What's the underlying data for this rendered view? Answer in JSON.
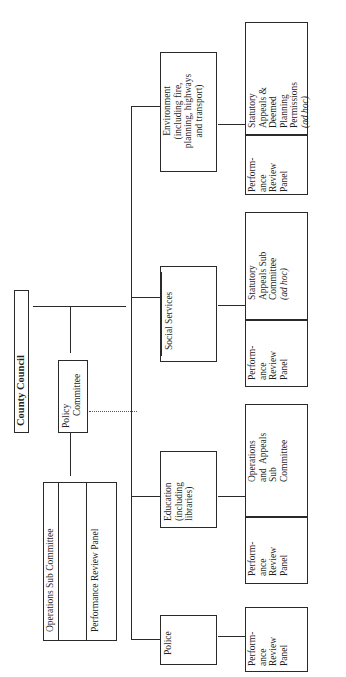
{
  "diagram": {
    "orientation": "rotated-90-ccw",
    "root": {
      "label": "County Council"
    },
    "policy": {
      "label_line1": "Policy",
      "label_line2": "Committee"
    },
    "policy_subs": {
      "ops_sub": "Operations Sub Committee",
      "perf_panel": "Performance Review Panel"
    },
    "departments": [
      {
        "name": "Environment",
        "lines": [
          "Environment",
          "(including fire,",
          "planning, highways",
          "and transport)"
        ],
        "children": [
          {
            "lines": [
              "Perform-",
              "ance",
              "Review",
              "Panel"
            ]
          },
          {
            "lines": [
              "Statutory",
              "Appeals &",
              "Deemed",
              "Planning",
              "Permissions"
            ],
            "note": "(ad hoc)"
          }
        ]
      },
      {
        "name": "Social Services",
        "lines": [
          "Social Services"
        ],
        "children": [
          {
            "lines": [
              "Perform-",
              "ance",
              "Review",
              "Panel"
            ]
          },
          {
            "lines": [
              "Statutory",
              "Appeals Sub",
              "Committee"
            ],
            "note": "(ad hoc)"
          }
        ]
      },
      {
        "name": "Education",
        "lines": [
          "Education",
          "(including",
          "libraries)"
        ],
        "children": [
          {
            "lines": [
              "Perform-",
              "ance",
              "Review",
              "Panel"
            ]
          },
          {
            "lines": [
              "Operations",
              "and  Appeals",
              "Sub",
              "Committee"
            ]
          }
        ]
      },
      {
        "name": "Police",
        "lines": [
          "Police"
        ],
        "children": [
          {
            "lines": [
              "Perform-",
              "ance",
              "Review",
              "Panel"
            ]
          }
        ]
      }
    ],
    "colors": {
      "line": "#2a2a2a",
      "text": "#1f1f1f",
      "background": "#ffffff"
    }
  }
}
